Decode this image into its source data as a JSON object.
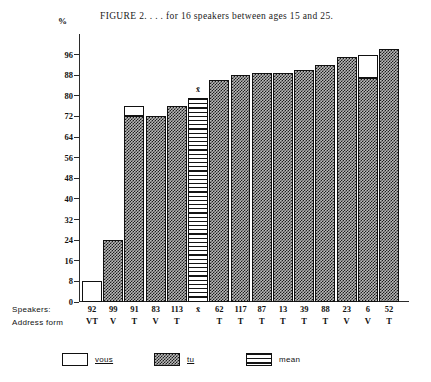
{
  "figure": {
    "title": "FIGURE 2.  . . . for 16 speakers between ages 15 and 25.",
    "y_axis_unit": "%",
    "row_label_speakers": "Speakers:",
    "row_label_address": "Address form",
    "mean_marker": "x̄"
  },
  "chart_data": {
    "type": "bar",
    "title": "FIGURE 2.  . . . for 16 speakers between ages 15 and 25.",
    "xlabel": "Speakers / Address form",
    "ylabel": "%",
    "ylim": [
      0,
      100
    ],
    "yticks": [
      0,
      8,
      16,
      24,
      32,
      40,
      48,
      56,
      64,
      72,
      80,
      88,
      96
    ],
    "grid": false,
    "legend_position": "bottom",
    "legend": [
      {
        "key": "vous",
        "label": "vous",
        "pattern": "white"
      },
      {
        "key": "tu",
        "label": "tu",
        "pattern": "checkered"
      },
      {
        "key": "mean",
        "label": "mean",
        "pattern": "horizontal-stripes"
      }
    ],
    "categories": [
      "92",
      "99",
      "91",
      "83",
      "113",
      "x̄",
      "62",
      "117",
      "87",
      "13",
      "39",
      "88",
      "23",
      "6",
      "52"
    ],
    "address_forms": [
      "VT",
      "V",
      "T",
      "V",
      "T",
      "",
      "T",
      "T",
      "T",
      "T",
      "T",
      "T",
      "V",
      "V",
      "T"
    ],
    "values": [
      8,
      24,
      76,
      72,
      76,
      79,
      86,
      88,
      89,
      89,
      90,
      92,
      95,
      96,
      98
    ],
    "bars": [
      {
        "speaker": "92",
        "address_form": "VT",
        "total": 8,
        "segments": [
          {
            "type": "vous",
            "from": 0,
            "to": 8
          }
        ]
      },
      {
        "speaker": "99",
        "address_form": "V",
        "total": 24,
        "segments": [
          {
            "type": "tu",
            "from": 0,
            "to": 24
          }
        ]
      },
      {
        "speaker": "91",
        "address_form": "T",
        "total": 76,
        "segments": [
          {
            "type": "tu",
            "from": 0,
            "to": 72
          },
          {
            "type": "vous",
            "from": 72,
            "to": 76
          }
        ]
      },
      {
        "speaker": "83",
        "address_form": "V",
        "total": 72,
        "segments": [
          {
            "type": "tu",
            "from": 0,
            "to": 72
          }
        ]
      },
      {
        "speaker": "113",
        "address_form": "T",
        "total": 76,
        "segments": [
          {
            "type": "tu",
            "from": 0,
            "to": 76
          }
        ]
      },
      {
        "speaker": "x̄",
        "address_form": "",
        "total": 79,
        "segments": [
          {
            "type": "mean",
            "from": 0,
            "to": 79
          }
        ]
      },
      {
        "speaker": "62",
        "address_form": "T",
        "total": 86,
        "segments": [
          {
            "type": "tu",
            "from": 0,
            "to": 86
          }
        ]
      },
      {
        "speaker": "117",
        "address_form": "T",
        "total": 88,
        "segments": [
          {
            "type": "tu",
            "from": 0,
            "to": 88
          }
        ]
      },
      {
        "speaker": "87",
        "address_form": "T",
        "total": 89,
        "segments": [
          {
            "type": "tu",
            "from": 0,
            "to": 89
          }
        ]
      },
      {
        "speaker": "13",
        "address_form": "T",
        "total": 89,
        "segments": [
          {
            "type": "tu",
            "from": 0,
            "to": 89
          }
        ]
      },
      {
        "speaker": "39",
        "address_form": "T",
        "total": 90,
        "segments": [
          {
            "type": "tu",
            "from": 0,
            "to": 90
          }
        ]
      },
      {
        "speaker": "88",
        "address_form": "T",
        "total": 92,
        "segments": [
          {
            "type": "tu",
            "from": 0,
            "to": 92
          }
        ]
      },
      {
        "speaker": "23",
        "address_form": "V",
        "total": 95,
        "segments": [
          {
            "type": "tu",
            "from": 0,
            "to": 95
          }
        ]
      },
      {
        "speaker": "6",
        "address_form": "V",
        "total": 96,
        "segments": [
          {
            "type": "tu",
            "from": 0,
            "to": 87
          },
          {
            "type": "vous",
            "from": 87,
            "to": 96
          }
        ]
      },
      {
        "speaker": "52",
        "address_form": "T",
        "total": 98,
        "segments": [
          {
            "type": "tu",
            "from": 0,
            "to": 98
          }
        ]
      }
    ]
  }
}
